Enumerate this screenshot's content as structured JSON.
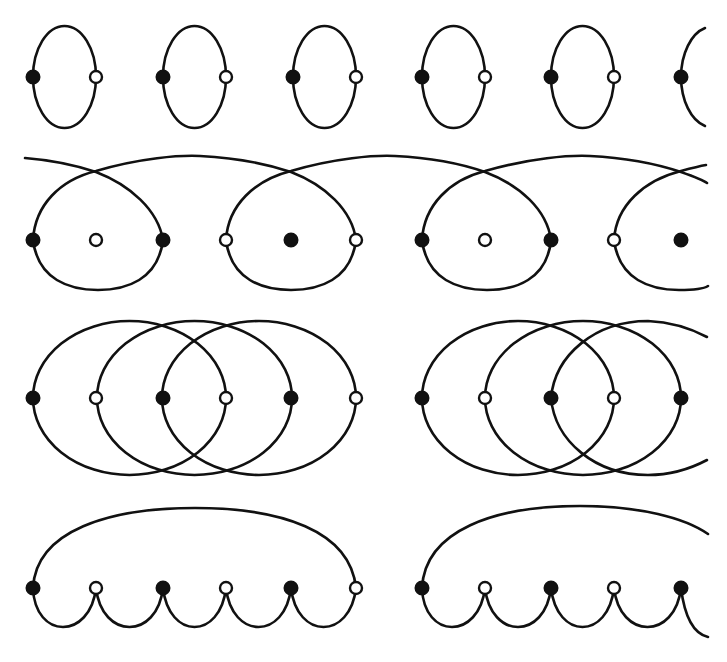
{
  "figure": {
    "colors": {
      "stroke": "#111111",
      "filled_node": "#111111",
      "open_node": "#ffffff",
      "background": "#ffffff"
    },
    "node_radius": 6.5,
    "columns_x": [
      33,
      96,
      163,
      226,
      291,
      356,
      422,
      485,
      551,
      614,
      681
    ],
    "rows": [
      {
        "name": "row-1-simple-bubbles",
        "baseline_y": 77,
        "nodes": [
          {
            "x": 33,
            "type": "filled"
          },
          {
            "x": 96,
            "type": "open"
          },
          {
            "x": 163,
            "type": "filled"
          },
          {
            "x": 226,
            "type": "open"
          },
          {
            "x": 293,
            "type": "filled"
          },
          {
            "x": 356,
            "type": "open"
          },
          {
            "x": 422,
            "type": "filled"
          },
          {
            "x": 485,
            "type": "open"
          },
          {
            "x": 551,
            "type": "filled"
          },
          {
            "x": 614,
            "type": "open"
          },
          {
            "x": 681,
            "type": "filled"
          }
        ]
      },
      {
        "name": "row-2-crossed-loops",
        "baseline_y": 240,
        "nodes": [
          {
            "x": 33,
            "type": "filled"
          },
          {
            "x": 96,
            "type": "open"
          },
          {
            "x": 163,
            "type": "filled"
          },
          {
            "x": 226,
            "type": "open"
          },
          {
            "x": 291,
            "type": "filled"
          },
          {
            "x": 356,
            "type": "open"
          },
          {
            "x": 422,
            "type": "filled"
          },
          {
            "x": 485,
            "type": "open"
          },
          {
            "x": 551,
            "type": "filled"
          },
          {
            "x": 614,
            "type": "open"
          },
          {
            "x": 681,
            "type": "filled"
          }
        ]
      },
      {
        "name": "row-3-overlapping-ellipses",
        "baseline_y": 398,
        "nodes": [
          {
            "x": 33,
            "type": "filled"
          },
          {
            "x": 96,
            "type": "open"
          },
          {
            "x": 163,
            "type": "filled"
          },
          {
            "x": 226,
            "type": "open"
          },
          {
            "x": 291,
            "type": "filled"
          },
          {
            "x": 356,
            "type": "open"
          },
          {
            "x": 422,
            "type": "filled"
          },
          {
            "x": 485,
            "type": "open"
          },
          {
            "x": 551,
            "type": "filled"
          },
          {
            "x": 614,
            "type": "open"
          },
          {
            "x": 681,
            "type": "filled"
          }
        ]
      },
      {
        "name": "row-4-scalloped-chain",
        "baseline_y": 588,
        "nodes": [
          {
            "x": 33,
            "type": "filled"
          },
          {
            "x": 96,
            "type": "open"
          },
          {
            "x": 163,
            "type": "filled"
          },
          {
            "x": 226,
            "type": "open"
          },
          {
            "x": 291,
            "type": "filled"
          },
          {
            "x": 356,
            "type": "open"
          },
          {
            "x": 422,
            "type": "filled"
          },
          {
            "x": 485,
            "type": "open"
          },
          {
            "x": 551,
            "type": "filled"
          },
          {
            "x": 614,
            "type": "open"
          },
          {
            "x": 681,
            "type": "filled"
          }
        ]
      }
    ]
  }
}
